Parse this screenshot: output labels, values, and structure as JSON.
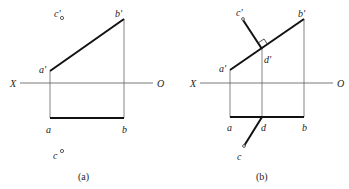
{
  "figure": {
    "panels": [
      {
        "id": "a",
        "caption": "(a)",
        "axis": {
          "left_label": "X",
          "right_label": "O"
        },
        "labels": {
          "a_prime": "a′",
          "b_prime": "b′",
          "c_prime": "c′",
          "a": "a",
          "b": "b",
          "c": "c"
        }
      },
      {
        "id": "b",
        "caption": "(b)",
        "axis": {
          "left_label": "X",
          "right_label": "O"
        },
        "labels": {
          "a_prime": "a′",
          "b_prime": "b′",
          "c_prime": "c′",
          "d_prime": "d′",
          "a": "a",
          "b": "b",
          "c": "c",
          "d": "d"
        }
      }
    ]
  }
}
